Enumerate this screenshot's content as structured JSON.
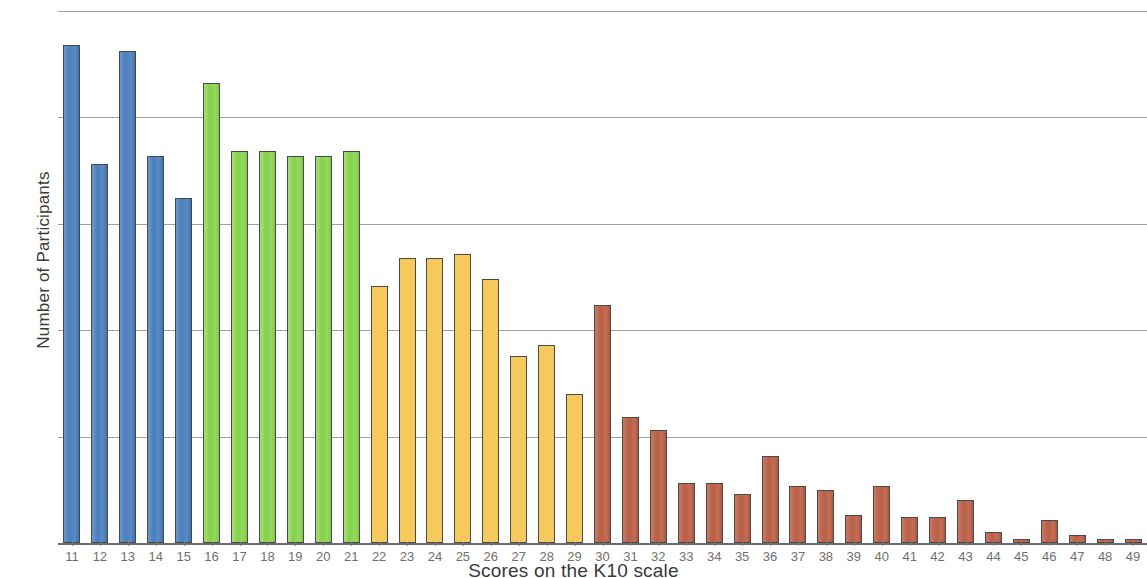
{
  "chart_data": {
    "type": "bar",
    "title": "",
    "xlabel": "Scores on the K10 scale",
    "ylabel": "Number of Participants",
    "grid": true,
    "legend": "none",
    "ylim": [
      0,
      25
    ],
    "gridline_values": [
      25,
      20,
      15,
      10,
      5
    ],
    "y_tick_labels_visible": false,
    "categories": [
      "11",
      "12",
      "13",
      "14",
      "15",
      "16",
      "17",
      "18",
      "19",
      "20",
      "21",
      "22",
      "23",
      "24",
      "25",
      "26",
      "27",
      "28",
      "29",
      "30",
      "31",
      "32",
      "33",
      "34",
      "35",
      "36",
      "37",
      "38",
      "39",
      "40",
      "41",
      "42",
      "43",
      "44",
      "45",
      "46",
      "47",
      "48",
      "49"
    ],
    "values": [
      23.4,
      17.8,
      23.1,
      18.2,
      16.2,
      21.6,
      18.4,
      18.4,
      18.2,
      18.2,
      18.4,
      12.1,
      13.4,
      13.4,
      13.6,
      12.4,
      8.8,
      9.3,
      7.0,
      11.2,
      5.9,
      5.3,
      2.8,
      2.8,
      2.3,
      4.1,
      2.7,
      2.5,
      1.3,
      2.7,
      1.2,
      1.2,
      2.0,
      0.5,
      0.2,
      1.1,
      0.4,
      0.2,
      0.2
    ],
    "colors": {
      "blue": "#4a7ebb",
      "green": "#87d14e",
      "yellow": "#f5c95c",
      "red": "#b85f48"
    },
    "color_groups": [
      {
        "name": "blue",
        "range": "11-15",
        "color": "#4a7ebb"
      },
      {
        "name": "green",
        "range": "16-21",
        "color": "#87d14e"
      },
      {
        "name": "yellow",
        "range": "22-29",
        "color": "#f5c95c"
      },
      {
        "name": "red",
        "range": "30-49",
        "color": "#b85f48"
      }
    ],
    "bar_color_index": [
      "blue",
      "blue",
      "blue",
      "blue",
      "blue",
      "green",
      "green",
      "green",
      "green",
      "green",
      "green",
      "yellow",
      "yellow",
      "yellow",
      "yellow",
      "yellow",
      "yellow",
      "yellow",
      "yellow",
      "red",
      "red",
      "red",
      "red",
      "red",
      "red",
      "red",
      "red",
      "red",
      "red",
      "red",
      "red",
      "red",
      "red",
      "red",
      "red",
      "red",
      "red",
      "red",
      "red"
    ]
  },
  "axes": {
    "y_title": "Number of Participants",
    "x_title": "Scores on the K10 scale"
  }
}
